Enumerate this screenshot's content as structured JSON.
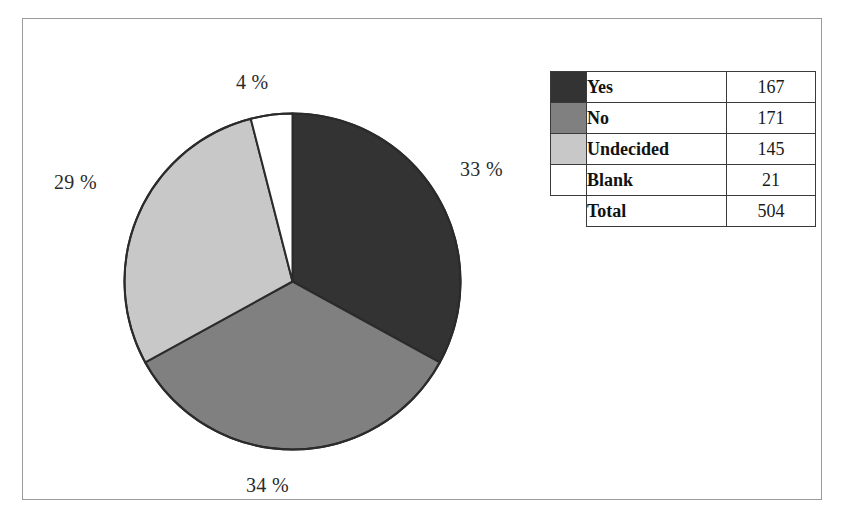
{
  "chart_data": {
    "type": "pie",
    "title": "",
    "categories": [
      "Yes",
      "No",
      "Undecided",
      "Blank"
    ],
    "values": [
      167,
      171,
      145,
      21
    ],
    "percent_labels": [
      "33 %",
      "34 %",
      "29 %",
      "4 %"
    ],
    "percents": [
      33,
      34,
      29,
      4
    ],
    "total_label": "Total",
    "total_value": 504,
    "colors": [
      "#333333",
      "#808080",
      "#c8c8c8",
      "#ffffff"
    ],
    "slice_outline_color": "#2b2b2b",
    "start_angle_deg": 0,
    "direction": "clockwise",
    "legend": {
      "position": "right",
      "rows": [
        {
          "label": "Yes",
          "value": "167",
          "color": "#333333"
        },
        {
          "label": "No",
          "value": "171",
          "color": "#808080"
        },
        {
          "label": "Undecided",
          "value": "145",
          "color": "#c8c8c8"
        },
        {
          "label": "Blank",
          "value": "21",
          "color": "#ffffff"
        },
        {
          "label": "Total",
          "value": "504",
          "color": null
        }
      ]
    },
    "grid": false,
    "xlabel": "",
    "ylabel": ""
  },
  "labels": {
    "blank_pct": "4 %",
    "yes_pct": "33 %",
    "undecided_pct": "29 %",
    "no_pct": "34 %"
  }
}
